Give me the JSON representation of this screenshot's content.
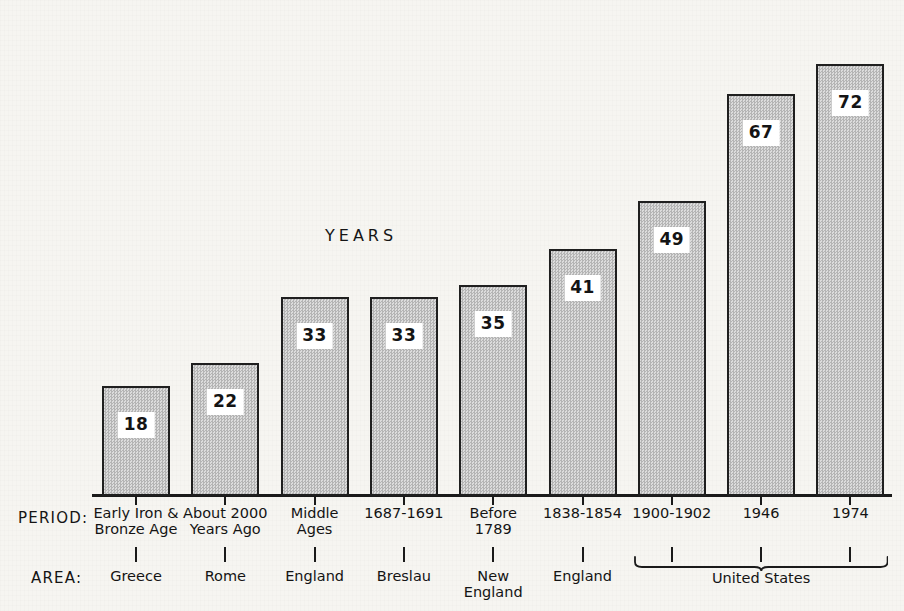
{
  "chart_data": {
    "type": "bar",
    "title": "YEARS",
    "xlabel": "",
    "ylabel": "YEARS",
    "ylim": [
      0,
      78
    ],
    "grid": false,
    "legend": "none",
    "categories": [
      "Early Iron & Bronze Age / Greece",
      "About 2000 Years Ago / Rome",
      "Middle Ages / England",
      "1687-1691 / Breslau",
      "Before 1789 / New England",
      "1838-1854 / England",
      "1900-1902 / United States",
      "1946 / United States",
      "1974 / United States"
    ],
    "values": [
      18,
      22,
      33,
      33,
      35,
      41,
      49,
      67,
      72
    ],
    "value_labels": [
      "18",
      "22",
      "33",
      "33",
      "35",
      "41",
      "49",
      "67",
      "72"
    ],
    "periods": [
      "Early Iron &\nBronze Age",
      "About 2000\nYears Ago",
      "Middle\nAges",
      "1687-1691",
      "Before\n1789",
      "1838-1854",
      "1900-1902",
      "1946",
      "1974"
    ],
    "areas": [
      "Greece",
      "Rome",
      "England",
      "Breslau",
      "New\nEngland",
      "England",
      "",
      "",
      ""
    ],
    "groups": [
      {
        "label": "United States",
        "first_index": 6,
        "last_index": 8
      }
    ],
    "row_headers": {
      "period": "PERIOD:",
      "area": "AREA:"
    },
    "colors": {
      "background": "#f6f5f1",
      "bar_fill": "#c9c9c9",
      "bar_border": "#1f1f1f",
      "axis": "#1a1a1a",
      "text": "#141414",
      "value_box": "#ffffff"
    }
  }
}
